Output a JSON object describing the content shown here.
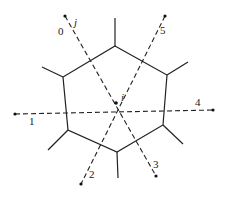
{
  "diagram": {
    "type": "voronoi-cell-with-neighbors",
    "center": {
      "label": "i",
      "x": 116,
      "y": 103
    },
    "hexagon_vertices": [
      {
        "x": 115,
        "y": 46
      },
      {
        "x": 167,
        "y": 75
      },
      {
        "x": 163,
        "y": 125
      },
      {
        "x": 117,
        "y": 152
      },
      {
        "x": 68,
        "y": 130
      },
      {
        "x": 63,
        "y": 77
      }
    ],
    "spokes": [
      {
        "from": 0,
        "x2": 115,
        "y2": 18
      },
      {
        "from": 1,
        "x2": 188,
        "y2": 62
      },
      {
        "from": 2,
        "x2": 183,
        "y2": 144
      },
      {
        "from": 3,
        "x2": 118,
        "y2": 178
      },
      {
        "from": 4,
        "x2": 48,
        "y2": 150
      },
      {
        "from": 5,
        "x2": 42,
        "y2": 67
      }
    ],
    "neighbors": [
      {
        "id": "0",
        "label": "0",
        "x": 65,
        "y": 16,
        "lx": 58,
        "ly": 35
      },
      {
        "id": "1",
        "label": "1",
        "x": 15,
        "y": 114,
        "lx": 30,
        "ly": 124
      },
      {
        "id": "2",
        "label": "2",
        "x": 81,
        "y": 184,
        "lx": 89,
        "ly": 178
      },
      {
        "id": "3",
        "label": "3",
        "x": 156,
        "y": 176,
        "lx": 153,
        "ly": 168
      },
      {
        "id": "4",
        "label": "4",
        "x": 213,
        "y": 110,
        "lx": 195,
        "ly": 105
      },
      {
        "id": "5",
        "label": "5",
        "x": 165,
        "y": 16,
        "lx": 160,
        "ly": 34
      }
    ],
    "labels": {
      "center": "i",
      "j": "j",
      "n0": "0",
      "n1": "1",
      "n2": "2",
      "n3": "3",
      "n4": "4",
      "n5": "5"
    },
    "colors": {
      "line": "#222222",
      "background": "#ffffff"
    }
  }
}
